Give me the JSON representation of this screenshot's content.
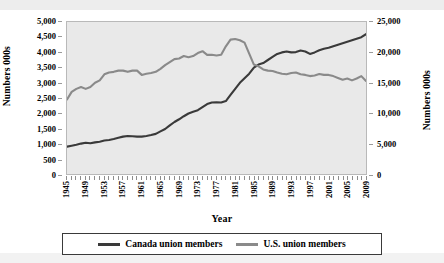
{
  "chart_data": {
    "type": "line",
    "title": "",
    "xlabel": "Year",
    "ylabel_left": "Numbers 000s",
    "ylabel_right": "Numbers 000s",
    "grid": false,
    "legend_position": "bottom",
    "ylim_left": [
      0,
      5000
    ],
    "ylim_right": [
      0,
      25000
    ],
    "yticks_left": [
      "0",
      "500",
      "1,000",
      "1,500",
      "2,000",
      "2,500",
      "3,000",
      "3,500",
      "4,000",
      "4,500",
      "5,000"
    ],
    "yticks_right": [
      "0",
      "5,000",
      "10,000",
      "15,000",
      "20,000",
      "25,000"
    ],
    "xlim": [
      1945,
      2009
    ],
    "xtick_labels": [
      "1945",
      "1949",
      "1953",
      "1957",
      "1961",
      "1965",
      "1969",
      "1973",
      "1977",
      "1981",
      "1985",
      "1989",
      "1993",
      "1997",
      "2001",
      "2005",
      "2009"
    ],
    "x": [
      1945,
      1946,
      1947,
      1948,
      1949,
      1950,
      1951,
      1952,
      1953,
      1954,
      1955,
      1956,
      1957,
      1958,
      1959,
      1960,
      1961,
      1962,
      1963,
      1964,
      1965,
      1966,
      1967,
      1968,
      1969,
      1970,
      1971,
      1972,
      1973,
      1974,
      1975,
      1976,
      1977,
      1978,
      1979,
      1980,
      1981,
      1982,
      1983,
      1984,
      1985,
      1986,
      1987,
      1988,
      1989,
      1990,
      1991,
      1992,
      1993,
      1994,
      1995,
      1996,
      1997,
      1998,
      1999,
      2000,
      2001,
      2002,
      2003,
      2004,
      2005,
      2006,
      2007,
      2008,
      2009
    ],
    "series": [
      {
        "name": "Canada union members",
        "axis": "left",
        "color": "#3a3a3a",
        "values": [
          900,
          930,
          960,
          1000,
          1030,
          1010,
          1040,
          1060,
          1100,
          1120,
          1150,
          1190,
          1230,
          1250,
          1240,
          1230,
          1230,
          1250,
          1280,
          1320,
          1400,
          1480,
          1600,
          1710,
          1800,
          1900,
          1990,
          2050,
          2100,
          2200,
          2300,
          2350,
          2360,
          2350,
          2400,
          2600,
          2800,
          3000,
          3150,
          3300,
          3500,
          3600,
          3650,
          3750,
          3850,
          3950,
          4000,
          4030,
          4000,
          4010,
          4060,
          4030,
          3950,
          4000,
          4070,
          4120,
          4150,
          4200,
          4250,
          4300,
          4350,
          4400,
          4450,
          4500,
          4600
        ]
      },
      {
        "name": "U.S. union members",
        "axis": "right",
        "color": "#8a8a8a",
        "values": [
          12250,
          13500,
          14000,
          14300,
          14000,
          14300,
          15000,
          15400,
          16400,
          16700,
          16800,
          17000,
          17000,
          16800,
          17000,
          17000,
          16300,
          16500,
          16600,
          16800,
          17300,
          17900,
          18400,
          18900,
          19000,
          19400,
          19200,
          19400,
          19900,
          20200,
          19600,
          19600,
          19500,
          19600,
          21000,
          22100,
          22200,
          22000,
          21600,
          19800,
          18000,
          17700,
          17200,
          17000,
          16950,
          16700,
          16500,
          16400,
          16600,
          16700,
          16400,
          16300,
          16100,
          16200,
          16450,
          16300,
          16300,
          16100,
          15800,
          15500,
          15700,
          15400,
          15700,
          16100,
          15300
        ]
      }
    ]
  },
  "legend": {
    "items": [
      {
        "label": "Canada union members",
        "color": "#3a3a3a"
      },
      {
        "label": "U.S. union members",
        "color": "#8a8a8a"
      }
    ]
  }
}
